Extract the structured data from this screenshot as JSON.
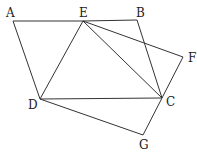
{
  "diagram": {
    "type": "geometry",
    "points": {
      "A": {
        "x": 13,
        "y": 21,
        "label": "A",
        "lx": 6,
        "ly": 17
      },
      "E": {
        "x": 83,
        "y": 21,
        "label": "E",
        "lx": 79,
        "ly": 17
      },
      "B": {
        "x": 137,
        "y": 20,
        "label": "B",
        "lx": 136,
        "ly": 17
      },
      "F": {
        "x": 183,
        "y": 57,
        "label": "F",
        "lx": 188,
        "ly": 62
      },
      "C": {
        "x": 162,
        "y": 98,
        "label": "C",
        "lx": 166,
        "ly": 106
      },
      "D": {
        "x": 40,
        "y": 99,
        "label": "D",
        "lx": 28,
        "ly": 109
      },
      "G": {
        "x": 143,
        "y": 135,
        "label": "G",
        "lx": 139,
        "ly": 149
      }
    },
    "segments": [
      [
        "A",
        "E"
      ],
      [
        "E",
        "B"
      ],
      [
        "B",
        "C"
      ],
      [
        "A",
        "D"
      ],
      [
        "D",
        "C"
      ],
      [
        "E",
        "D"
      ],
      [
        "E",
        "C"
      ],
      [
        "E",
        "F"
      ],
      [
        "F",
        "C"
      ],
      [
        "C",
        "G"
      ],
      [
        "D",
        "G"
      ]
    ]
  }
}
